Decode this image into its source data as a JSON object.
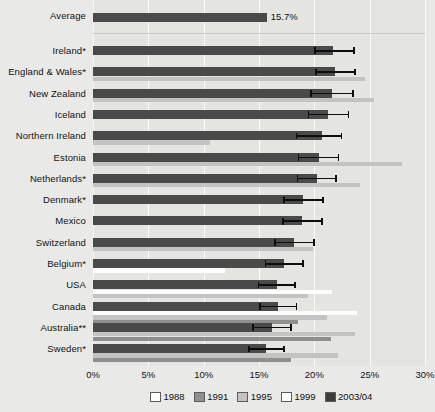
{
  "chart_data": {
    "type": "bar",
    "orientation": "horizontal",
    "title": "",
    "xlabel": "",
    "ylabel": "",
    "xlim": [
      0,
      30
    ],
    "xticks": [
      "0%",
      "5%",
      "10%",
      "15%",
      "20%",
      "25%",
      "30%"
    ],
    "xtick_values": [
      0,
      5,
      10,
      15,
      20,
      25,
      30
    ],
    "grid": true,
    "legend_position": "bottom-right",
    "average": {
      "label": "Average",
      "value": 15.7,
      "value_label": "15.7%",
      "series": "2003/04"
    },
    "series_order": [
      "1988",
      "1991",
      "1995",
      "1999",
      "2003/04"
    ],
    "series_colors": {
      "1988": "#ffffff",
      "1991": "#8f8f8f",
      "1995": "#c3c3c3",
      "1999": "#fdfdfd",
      "2003/04": "#4a4a4a"
    },
    "categories": [
      "Ireland*",
      "England & Wales*",
      "New Zealand",
      "Iceland",
      "Northern Ireland",
      "Estonia",
      "Netherlands*",
      "Denmark*",
      "Mexico",
      "Switzerland",
      "Belgium*",
      "USA",
      "Canada",
      "Australia**",
      "Sweden*"
    ],
    "series": [
      {
        "name": "2003/04",
        "values": [
          21.7,
          21.9,
          21.6,
          21.2,
          20.7,
          20.4,
          20.2,
          19.0,
          18.9,
          18.2,
          17.3,
          16.6,
          16.7,
          16.2,
          15.6
        ]
      },
      {
        "name": "1999",
        "values": [
          null,
          null,
          null,
          null,
          null,
          null,
          null,
          null,
          null,
          null,
          11.9,
          21.6,
          23.9,
          null,
          null
        ]
      },
      {
        "name": "1995",
        "values": [
          null,
          24.6,
          25.4,
          null,
          10.6,
          27.9,
          24.1,
          null,
          null,
          19.9,
          null,
          19.4,
          21.1,
          23.7,
          22.1
        ]
      },
      {
        "name": "1991",
        "values": [
          null,
          null,
          null,
          null,
          null,
          null,
          null,
          null,
          null,
          null,
          null,
          null,
          18.5,
          21.5,
          17.9
        ]
      },
      {
        "name": "1988",
        "values": [
          null,
          null,
          null,
          null,
          null,
          null,
          null,
          null,
          null,
          null,
          null,
          null,
          null,
          null,
          null
        ]
      }
    ],
    "error_bars": {
      "series": "2003/04",
      "lower": [
        20.0,
        20.1,
        19.6,
        19.4,
        18.3,
        18.5,
        18.4,
        17.2,
        17.1,
        16.4,
        15.5,
        14.9,
        15.0,
        14.4,
        14.0
      ],
      "upper": [
        23.5,
        23.6,
        23.4,
        23.0,
        22.4,
        22.1,
        21.9,
        20.7,
        20.6,
        19.9,
        18.9,
        18.2,
        18.3,
        17.8,
        17.2
      ]
    }
  },
  "legend": {
    "items": [
      {
        "label": "1988",
        "color": "#ffffff"
      },
      {
        "label": "1991",
        "color": "#8f8f8f"
      },
      {
        "label": "1995",
        "color": "#c3c3c3"
      },
      {
        "label": "1999",
        "color": "#fdfdfd"
      },
      {
        "label": "2003/04",
        "color": "#3d3d3d"
      }
    ]
  }
}
